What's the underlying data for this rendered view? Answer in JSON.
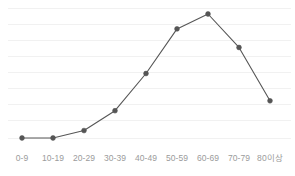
{
  "chart_data": {
    "type": "line",
    "title": "",
    "subtitle": "",
    "xlabel": "",
    "ylabel": "",
    "categories": [
      "0-9",
      "10-19",
      "20-29",
      "30-39",
      "40-49",
      "50-59",
      "60-69",
      "70-79",
      "80이상"
    ],
    "values": [
      0,
      0,
      6,
      22,
      52,
      88,
      100,
      73,
      30
    ],
    "series": [
      {
        "name": "",
        "values": [
          0,
          0,
          6,
          22,
          52,
          88,
          100,
          73,
          30
        ]
      }
    ],
    "ylim": [
      0,
      110
    ],
    "grid": true,
    "gridline_count": 9,
    "legend": "none",
    "marker": "circle",
    "line_color": "#565656",
    "marker_color": "#555555",
    "grid_color": "#f1f1f1",
    "axis_label_color": "#9b9b9b",
    "background_color": "#ffffff",
    "annotations": []
  },
  "axis": {
    "x_tick_labels": [
      "0-9",
      "10-19",
      "20-29",
      "30-39",
      "40-49",
      "50-59",
      "60-69",
      "70-79",
      "80이상"
    ],
    "y_tick_labels": []
  }
}
